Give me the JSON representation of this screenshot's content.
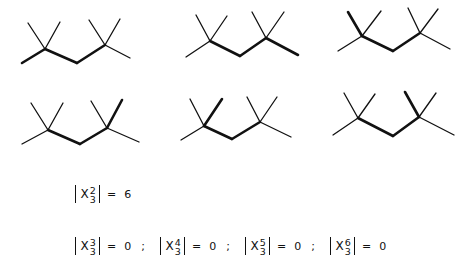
{
  "diagram": {
    "line_color": "#111111",
    "thin_width": 1.3,
    "bold_width": 2.6
  },
  "molecules": [
    {
      "label": "molecule-1",
      "bonds": [
        {
          "x1": 45,
          "y1": 49,
          "x2": 28,
          "y2": 23,
          "bold": false
        },
        {
          "x1": 45,
          "y1": 49,
          "x2": 60,
          "y2": 22,
          "bold": false
        },
        {
          "x1": 45,
          "y1": 49,
          "x2": 22,
          "y2": 63,
          "bold": true
        },
        {
          "x1": 45,
          "y1": 49,
          "x2": 77,
          "y2": 63,
          "bold": true
        },
        {
          "x1": 77,
          "y1": 63,
          "x2": 105,
          "y2": 45,
          "bold": true
        },
        {
          "x1": 105,
          "y1": 45,
          "x2": 89,
          "y2": 20,
          "bold": false
        },
        {
          "x1": 105,
          "y1": 45,
          "x2": 120,
          "y2": 19,
          "bold": false
        },
        {
          "x1": 105,
          "y1": 45,
          "x2": 130,
          "y2": 58,
          "bold": false
        }
      ]
    },
    {
      "label": "molecule-2",
      "bonds": [
        {
          "x1": 210,
          "y1": 41,
          "x2": 196,
          "y2": 15,
          "bold": false
        },
        {
          "x1": 210,
          "y1": 41,
          "x2": 227,
          "y2": 16,
          "bold": false
        },
        {
          "x1": 210,
          "y1": 41,
          "x2": 186,
          "y2": 57,
          "bold": false
        },
        {
          "x1": 210,
          "y1": 41,
          "x2": 240,
          "y2": 56,
          "bold": true
        },
        {
          "x1": 240,
          "y1": 56,
          "x2": 266,
          "y2": 38,
          "bold": true
        },
        {
          "x1": 266,
          "y1": 38,
          "x2": 252,
          "y2": 12,
          "bold": false
        },
        {
          "x1": 266,
          "y1": 38,
          "x2": 284,
          "y2": 12,
          "bold": false
        },
        {
          "x1": 266,
          "y1": 38,
          "x2": 298,
          "y2": 55,
          "bold": true
        }
      ]
    },
    {
      "label": "molecule-3",
      "bonds": [
        {
          "x1": 362,
          "y1": 36,
          "x2": 348,
          "y2": 12,
          "bold": true
        },
        {
          "x1": 362,
          "y1": 36,
          "x2": 381,
          "y2": 11,
          "bold": false
        },
        {
          "x1": 362,
          "y1": 36,
          "x2": 338,
          "y2": 51,
          "bold": false
        },
        {
          "x1": 362,
          "y1": 36,
          "x2": 393,
          "y2": 51,
          "bold": true
        },
        {
          "x1": 393,
          "y1": 51,
          "x2": 420,
          "y2": 33,
          "bold": true
        },
        {
          "x1": 420,
          "y1": 33,
          "x2": 408,
          "y2": 8,
          "bold": false
        },
        {
          "x1": 420,
          "y1": 33,
          "x2": 438,
          "y2": 9,
          "bold": false
        },
        {
          "x1": 420,
          "y1": 33,
          "x2": 450,
          "y2": 49,
          "bold": false
        }
      ]
    },
    {
      "label": "molecule-4",
      "bonds": [
        {
          "x1": 48,
          "y1": 130,
          "x2": 31,
          "y2": 103,
          "bold": false
        },
        {
          "x1": 48,
          "y1": 130,
          "x2": 63,
          "y2": 103,
          "bold": false
        },
        {
          "x1": 48,
          "y1": 130,
          "x2": 22,
          "y2": 144,
          "bold": false
        },
        {
          "x1": 48,
          "y1": 130,
          "x2": 80,
          "y2": 144,
          "bold": true
        },
        {
          "x1": 80,
          "y1": 144,
          "x2": 107,
          "y2": 128,
          "bold": true
        },
        {
          "x1": 107,
          "y1": 128,
          "x2": 91,
          "y2": 101,
          "bold": false
        },
        {
          "x1": 107,
          "y1": 128,
          "x2": 122,
          "y2": 100,
          "bold": true
        },
        {
          "x1": 107,
          "y1": 128,
          "x2": 139,
          "y2": 142,
          "bold": false
        }
      ]
    },
    {
      "label": "molecule-5",
      "bonds": [
        {
          "x1": 204,
          "y1": 126,
          "x2": 190,
          "y2": 99,
          "bold": false
        },
        {
          "x1": 204,
          "y1": 126,
          "x2": 222,
          "y2": 99,
          "bold": true
        },
        {
          "x1": 204,
          "y1": 126,
          "x2": 181,
          "y2": 140,
          "bold": false
        },
        {
          "x1": 204,
          "y1": 126,
          "x2": 232,
          "y2": 139,
          "bold": true
        },
        {
          "x1": 232,
          "y1": 139,
          "x2": 260,
          "y2": 122,
          "bold": true
        },
        {
          "x1": 260,
          "y1": 122,
          "x2": 247,
          "y2": 97,
          "bold": false
        },
        {
          "x1": 260,
          "y1": 122,
          "x2": 277,
          "y2": 97,
          "bold": false
        },
        {
          "x1": 260,
          "y1": 122,
          "x2": 291,
          "y2": 137,
          "bold": false
        }
      ]
    },
    {
      "label": "molecule-6",
      "bonds": [
        {
          "x1": 358,
          "y1": 118,
          "x2": 344,
          "y2": 93,
          "bold": false
        },
        {
          "x1": 358,
          "y1": 118,
          "x2": 375,
          "y2": 94,
          "bold": false
        },
        {
          "x1": 358,
          "y1": 118,
          "x2": 333,
          "y2": 135,
          "bold": false
        },
        {
          "x1": 358,
          "y1": 118,
          "x2": 393,
          "y2": 136,
          "bold": true
        },
        {
          "x1": 393,
          "y1": 136,
          "x2": 419,
          "y2": 117,
          "bold": true
        },
        {
          "x1": 419,
          "y1": 117,
          "x2": 405,
          "y2": 92,
          "bold": true
        },
        {
          "x1": 419,
          "y1": 117,
          "x2": 436,
          "y2": 93,
          "bold": false
        },
        {
          "x1": 419,
          "y1": 117,
          "x2": 454,
          "y2": 135,
          "bold": false
        }
      ]
    }
  ],
  "formulas": {
    "line1": [
      {
        "var": "X",
        "sup": "2",
        "sub": "3",
        "eq": "=",
        "value": "6"
      }
    ],
    "line2": [
      {
        "var": "X",
        "sup": "3",
        "sub": "3",
        "eq": "=",
        "value": "0",
        "sep": ";"
      },
      {
        "var": "X",
        "sup": "4",
        "sub": "3",
        "eq": "=",
        "value": "0",
        "sep": ";"
      },
      {
        "var": "X",
        "sup": "5",
        "sub": "3",
        "eq": "=",
        "value": "0",
        "sep": ";"
      },
      {
        "var": "X",
        "sup": "6",
        "sub": "3",
        "eq": "=",
        "value": "0"
      }
    ]
  }
}
